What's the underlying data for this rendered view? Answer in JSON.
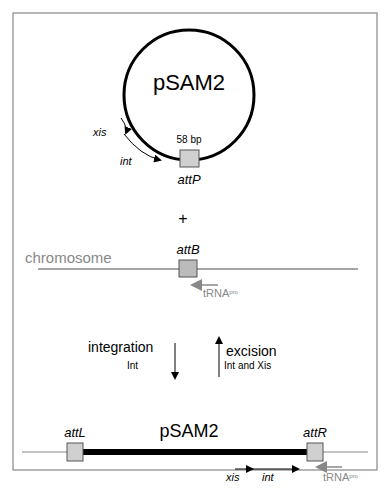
{
  "plasmid": {
    "name": "pSAM2",
    "site_size": "58 bp",
    "site": "attP",
    "genes": [
      "xis",
      "int"
    ]
  },
  "operator": "+",
  "chromosome": {
    "label": "chromosome",
    "site": "attB",
    "trna": "tRNA",
    "trna_sup": "pro"
  },
  "reactions": {
    "integration": {
      "label": "integration",
      "enzyme": "Int"
    },
    "excision": {
      "label": "excision",
      "enzyme": "Int and Xis"
    }
  },
  "integrated": {
    "name": "pSAM2",
    "left_site": "attL",
    "right_site": "attR",
    "genes": [
      "xis",
      "int"
    ],
    "trna": "tRNA",
    "trna_sup": "pro"
  },
  "colors": {
    "frame": "#888888",
    "chromosome": "#888888",
    "site_fill": "#d0d0d0",
    "trna_arrow": "#888888"
  }
}
